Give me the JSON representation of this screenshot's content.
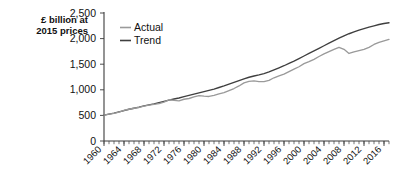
{
  "chart_data": {
    "type": "line",
    "title": "",
    "subtitle": "",
    "xlabel": "",
    "ylabel": "£ billion at 2015 prices",
    "ylabel_line1": "£ billion at",
    "ylabel_line2": "2015 prices",
    "xlim": [
      1960,
      2017
    ],
    "ylim": [
      0,
      2500
    ],
    "ytick_labels": [
      "0",
      "500",
      "1,000",
      "1,500",
      "2,000",
      "2,500"
    ],
    "ytick_values": [
      0,
      500,
      1000,
      1500,
      2000,
      2500
    ],
    "xtick_labels": [
      "1960",
      "1964",
      "1968",
      "1972",
      "1976",
      "1980",
      "1984",
      "1988",
      "1992",
      "1996",
      "2000",
      "2004",
      "2008",
      "2012",
      "2016"
    ],
    "xtick_values": [
      1960,
      1964,
      1968,
      1972,
      1976,
      1980,
      1984,
      1988,
      1992,
      1996,
      2000,
      2004,
      2008,
      2012,
      2016
    ],
    "minor_xtick_interval": 1,
    "grid": false,
    "legend_position": "top-left-inside",
    "legend": [
      "Actual",
      "Trend"
    ],
    "colors": {
      "actual": "#9a9a9a",
      "trend": "#3f3f3f",
      "axis": "#3b3b3b",
      "text": "#111111",
      "background": "#ffffff"
    },
    "x": [
      1960,
      1961,
      1962,
      1963,
      1964,
      1965,
      1966,
      1967,
      1968,
      1969,
      1970,
      1971,
      1972,
      1973,
      1974,
      1975,
      1976,
      1977,
      1978,
      1979,
      1980,
      1981,
      1982,
      1983,
      1984,
      1985,
      1986,
      1987,
      1988,
      1989,
      1990,
      1991,
      1992,
      1993,
      1994,
      1995,
      1996,
      1997,
      1998,
      1999,
      2000,
      2001,
      2002,
      2003,
      2004,
      2005,
      2006,
      2007,
      2008,
      2009,
      2010,
      2011,
      2012,
      2013,
      2014,
      2015,
      2016,
      2017
    ],
    "series": [
      {
        "name": "Actual",
        "color": "#9a9a9a",
        "values": [
          505,
          525,
          540,
          565,
          600,
          620,
          640,
          655,
          680,
          700,
          715,
          730,
          760,
          805,
          795,
          785,
          815,
          830,
          860,
          885,
          875,
          870,
          890,
          920,
          945,
          985,
          1025,
          1075,
          1135,
          1165,
          1175,
          1160,
          1160,
          1185,
          1235,
          1270,
          1305,
          1355,
          1405,
          1450,
          1510,
          1550,
          1595,
          1650,
          1700,
          1745,
          1790,
          1830,
          1790,
          1710,
          1740,
          1765,
          1790,
          1830,
          1885,
          1925,
          1955,
          1985
        ]
      },
      {
        "name": "Trend",
        "color": "#3f3f3f",
        "values": [
          505,
          525,
          545,
          570,
          595,
          620,
          640,
          660,
          685,
          705,
          725,
          750,
          775,
          800,
          820,
          840,
          865,
          890,
          915,
          940,
          965,
          990,
          1015,
          1045,
          1075,
          1110,
          1145,
          1180,
          1215,
          1245,
          1270,
          1290,
          1315,
          1350,
          1390,
          1430,
          1470,
          1515,
          1560,
          1610,
          1660,
          1710,
          1760,
          1810,
          1860,
          1910,
          1960,
          2010,
          2055,
          2095,
          2130,
          2165,
          2195,
          2225,
          2250,
          2275,
          2295,
          2310
        ]
      }
    ],
    "annotations": [
      {
        "label": "actual dips below trend",
        "x": 1975
      },
      {
        "label": "post-2008 divergence",
        "x": 2009
      }
    ]
  }
}
